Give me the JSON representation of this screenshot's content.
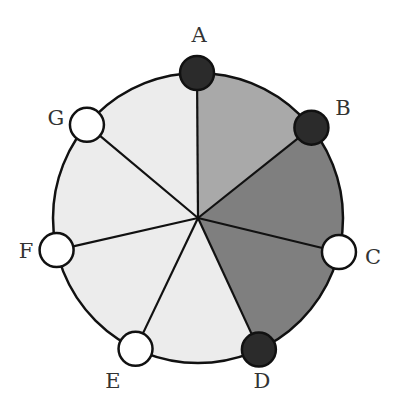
{
  "diagram": {
    "colors": {
      "light_sector": "#ececec",
      "medium_sector": "#a9a9a9",
      "dark_sector": "#7f7f7f",
      "filled_vertex": "#2b2b2b",
      "empty_vertex": "#ffffff",
      "stroke": "#111111"
    },
    "vertices": [
      {
        "label": "A",
        "filled": true
      },
      {
        "label": "B",
        "filled": true
      },
      {
        "label": "C",
        "filled": false
      },
      {
        "label": "D",
        "filled": true
      },
      {
        "label": "E",
        "filled": false
      },
      {
        "label": "F",
        "filled": false
      },
      {
        "label": "G",
        "filled": false
      }
    ],
    "sectors": [
      {
        "from": "A",
        "to": "B",
        "shade": "medium"
      },
      {
        "from": "B",
        "to": "C",
        "shade": "dark"
      },
      {
        "from": "C",
        "to": "D",
        "shade": "dark"
      },
      {
        "from": "D",
        "to": "E",
        "shade": "light"
      },
      {
        "from": "E",
        "to": "F",
        "shade": "light"
      },
      {
        "from": "F",
        "to": "G",
        "shade": "light"
      },
      {
        "from": "G",
        "to": "A",
        "shade": "light"
      }
    ]
  }
}
